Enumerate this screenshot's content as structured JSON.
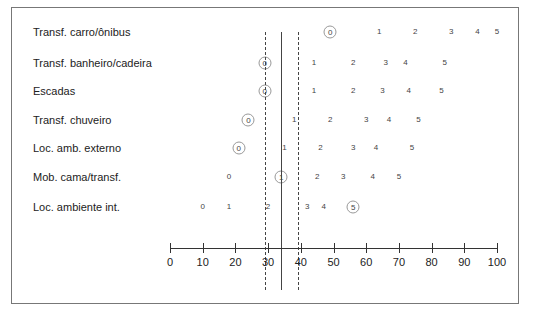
{
  "chart_data": {
    "type": "nomogram",
    "title": "",
    "axis": {
      "min": 0,
      "max": 100,
      "ticks": [
        0,
        10,
        20,
        30,
        40,
        50,
        60,
        70,
        80,
        90,
        100
      ],
      "tick_labels": [
        "0",
        "10",
        "20",
        "30",
        "40",
        "50",
        "60",
        "70",
        "80",
        "90",
        "100"
      ]
    },
    "reference_lines": [
      {
        "type": "dashed",
        "value": 29
      },
      {
        "type": "solid",
        "value": 34
      },
      {
        "type": "dashed",
        "value": 39
      }
    ],
    "rows": [
      {
        "label": "Transf. carro/ônibus",
        "scores": [
          {
            "level": "0",
            "value": 49,
            "circled": true
          },
          {
            "level": "1",
            "value": 64,
            "circled": false
          },
          {
            "level": "2",
            "value": 75,
            "circled": false
          },
          {
            "level": "3",
            "value": 86,
            "circled": false
          },
          {
            "level": "4",
            "value": 94,
            "circled": false
          },
          {
            "level": "5",
            "value": 100,
            "circled": false
          }
        ]
      },
      {
        "label": "Transf. banheiro/cadeira",
        "scores": [
          {
            "level": "0",
            "value": 29,
            "circled": true
          },
          {
            "level": "1",
            "value": 44,
            "circled": false
          },
          {
            "level": "2",
            "value": 56,
            "circled": false
          },
          {
            "level": "3",
            "value": 66,
            "circled": false
          },
          {
            "level": "4",
            "value": 72,
            "circled": false
          },
          {
            "level": "5",
            "value": 84,
            "circled": false
          }
        ]
      },
      {
        "label": "Escadas",
        "scores": [
          {
            "level": "0",
            "value": 29,
            "circled": true
          },
          {
            "level": "1",
            "value": 44,
            "circled": false
          },
          {
            "level": "2",
            "value": 56,
            "circled": false
          },
          {
            "level": "3",
            "value": 65,
            "circled": false
          },
          {
            "level": "4",
            "value": 73,
            "circled": false
          },
          {
            "level": "5",
            "value": 83,
            "circled": false
          }
        ]
      },
      {
        "label": "Transf. chuveiro",
        "scores": [
          {
            "level": "0",
            "value": 24,
            "circled": true
          },
          {
            "level": "1",
            "value": 38,
            "circled": false
          },
          {
            "level": "2",
            "value": 49,
            "circled": false
          },
          {
            "level": "3",
            "value": 60,
            "circled": false
          },
          {
            "level": "4",
            "value": 67,
            "circled": false
          },
          {
            "level": "5",
            "value": 76,
            "circled": false
          }
        ]
      },
      {
        "label": "Loc. amb. externo",
        "scores": [
          {
            "level": "0",
            "value": 21,
            "circled": true
          },
          {
            "level": "1",
            "value": 35,
            "circled": false
          },
          {
            "level": "2",
            "value": 46,
            "circled": false
          },
          {
            "level": "3",
            "value": 56,
            "circled": false
          },
          {
            "level": "4",
            "value": 63,
            "circled": false
          },
          {
            "level": "5",
            "value": 74,
            "circled": false
          }
        ]
      },
      {
        "label": "Mob. cama/transf.",
        "scores": [
          {
            "level": "0",
            "value": 18,
            "circled": false
          },
          {
            "level": "1",
            "value": 34,
            "circled": true
          },
          {
            "level": "2",
            "value": 45,
            "circled": false
          },
          {
            "level": "3",
            "value": 53,
            "circled": false
          },
          {
            "level": "4",
            "value": 62,
            "circled": false
          },
          {
            "level": "5",
            "value": 70,
            "circled": false
          }
        ]
      },
      {
        "label": "Loc. ambiente int.",
        "scores": [
          {
            "level": "0",
            "value": 10,
            "circled": false
          },
          {
            "level": "1",
            "value": 18,
            "circled": false
          },
          {
            "level": "2",
            "value": 30,
            "circled": false
          },
          {
            "level": "3",
            "value": 42,
            "circled": false
          },
          {
            "level": "4",
            "value": 47,
            "circled": false
          },
          {
            "level": "5",
            "value": 56,
            "circled": true
          }
        ]
      }
    ]
  }
}
